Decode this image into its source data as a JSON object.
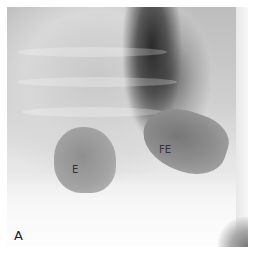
{
  "figure": {
    "panel_label": "A",
    "annotations": [
      {
        "id": "stomach",
        "text": "E"
      },
      {
        "id": "fundic-air",
        "text": "FE"
      }
    ]
  }
}
